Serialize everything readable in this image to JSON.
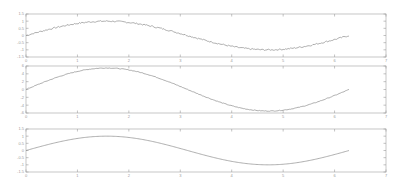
{
  "figure": {
    "background": "#ffffff",
    "line_color": "#8c8c8c",
    "axis_color": "#b8b8b8"
  },
  "chart_data": [
    {
      "type": "line",
      "title": "",
      "xlabel": "",
      "ylabel": "",
      "xlim": [
        0,
        7
      ],
      "ylim": [
        -1.5,
        1.5
      ],
      "xticks": [
        "0",
        "1",
        "2",
        "3",
        "4",
        "5",
        "6",
        "7"
      ],
      "yticks": [
        "1.5",
        "1",
        "0.5",
        "0",
        "-0.5",
        "-1",
        "-1.5"
      ],
      "grid": false,
      "series": [
        {
          "name": "noisy sine",
          "function": "sin(x) + noise",
          "noise_amplitude": 0.05,
          "x": [
            0,
            0.5,
            1,
            1.5,
            2,
            2.5,
            3,
            3.5,
            4,
            4.5,
            5,
            5.5,
            6,
            6.28
          ],
          "values": [
            0.0,
            0.48,
            0.84,
            1.0,
            0.91,
            0.6,
            0.14,
            -0.35,
            -0.76,
            -0.98,
            -0.96,
            -0.71,
            -0.28,
            0.0
          ]
        }
      ]
    },
    {
      "type": "line",
      "title": "",
      "xlabel": "",
      "ylabel": "",
      "xlim": [
        0,
        7
      ],
      "ylim": [
        -6,
        6
      ],
      "xticks": [
        "0",
        "1",
        "2",
        "3",
        "4",
        "5",
        "6",
        "7"
      ],
      "yticks": [
        "6",
        "4",
        "2",
        "0",
        "-2",
        "-4",
        "-6"
      ],
      "grid": false,
      "series": [
        {
          "name": "scaled sine",
          "function": "5.5*sin(x) + small noise",
          "noise_amplitude": 0.08,
          "x": [
            0,
            0.5,
            1,
            1.5,
            2,
            2.5,
            3,
            3.5,
            4,
            4.5,
            5,
            5.5,
            6,
            6.28
          ],
          "values": [
            0.0,
            2.64,
            4.63,
            5.49,
            5.0,
            3.29,
            0.78,
            -1.93,
            -4.16,
            -5.38,
            -5.27,
            -3.89,
            -1.54,
            0.0
          ]
        }
      ]
    },
    {
      "type": "line",
      "title": "",
      "xlabel": "",
      "ylabel": "",
      "xlim": [
        0,
        7
      ],
      "ylim": [
        -1.5,
        1.5
      ],
      "xticks": [
        "0",
        "1",
        "2",
        "3",
        "4",
        "5",
        "6",
        "7"
      ],
      "yticks": [
        "1.5",
        "1",
        "0.5",
        "0",
        "-0.5",
        "-1",
        "-1.5"
      ],
      "grid": false,
      "series": [
        {
          "name": "smooth sine",
          "function": "sin(x)",
          "x": [
            0,
            0.5,
            1,
            1.5,
            2,
            2.5,
            3,
            3.5,
            4,
            4.5,
            5,
            5.5,
            6,
            6.28
          ],
          "values": [
            0.0,
            0.48,
            0.84,
            1.0,
            0.91,
            0.6,
            0.14,
            -0.35,
            -0.76,
            -0.98,
            -0.96,
            -0.71,
            -0.28,
            0.0
          ]
        }
      ]
    }
  ]
}
